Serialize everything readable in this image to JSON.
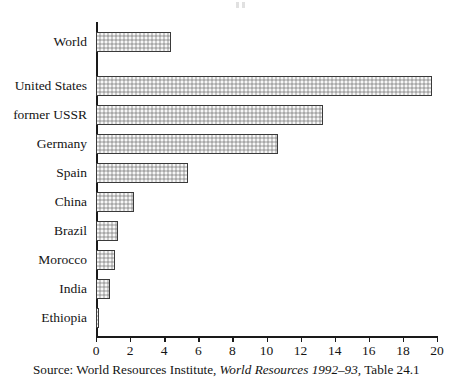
{
  "chart_data": {
    "type": "bar",
    "orientation": "horizontal",
    "title": "",
    "xlabel": "",
    "ylabel": "",
    "xlim": [
      0,
      20
    ],
    "xticks": [
      0,
      2,
      4,
      6,
      8,
      10,
      12,
      14,
      16,
      18,
      20
    ],
    "grid": false,
    "legend": null,
    "categories": [
      "World",
      "United States",
      "former USSR",
      "Germany",
      "Spain",
      "China",
      "Brazil",
      "Morocco",
      "India",
      "Ethiopia"
    ],
    "values": [
      4.4,
      19.7,
      13.3,
      10.7,
      5.4,
      2.2,
      1.3,
      1.1,
      0.85,
      0.15
    ],
    "bar_fill": "#c9c9c9",
    "bar_edge": "#3a3a3a"
  },
  "source_note": {
    "prefix": "Source: World Resources Institute, ",
    "italic_title": "World Resources 1992–93",
    "suffix": ", Table 24.1"
  }
}
